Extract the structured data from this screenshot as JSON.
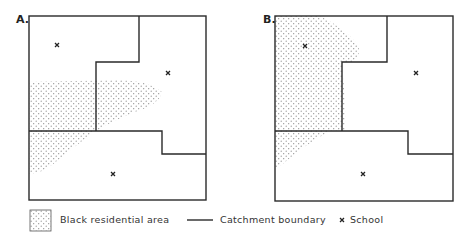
{
  "panels": [
    {
      "label": "A.",
      "schools": [
        {
          "name": "school-north-west",
          "x": 57,
          "y": 45
        },
        {
          "name": "school-east",
          "x": 168,
          "y": 73
        },
        {
          "name": "school-south",
          "x": 113,
          "y": 174
        }
      ]
    },
    {
      "label": "B.",
      "schools": [
        {
          "name": "school-north-west",
          "x": 305,
          "y": 46
        },
        {
          "name": "school-east",
          "x": 363,
          "y": 73
        },
        {
          "name": "school-south",
          "x": 363,
          "y": 174
        }
      ]
    }
  ],
  "legend": {
    "residential_label": "Black residential area",
    "boundary_label": "Catchment boundary",
    "school_marker": "x",
    "school_label": "School"
  },
  "colors": {
    "line": "#2a2a2a",
    "dots": "#8a8a8a",
    "background": "#ffffff"
  }
}
